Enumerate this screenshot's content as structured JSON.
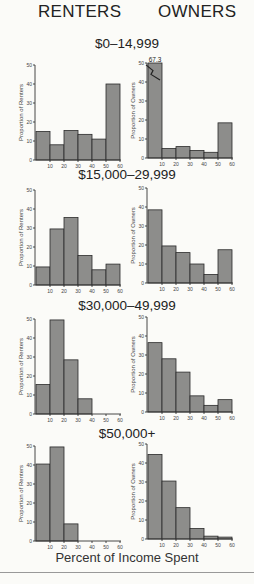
{
  "headers": {
    "renters": "RENTERS",
    "owners": "OWNERS"
  },
  "x_axis_label": "Percent of Income Spent",
  "chart_data": {
    "type": "bar",
    "title": "",
    "xlabel": "Percent of Income Spent",
    "column_titles": [
      "RENTERS",
      "OWNERS"
    ],
    "x_bins": [
      [
        0,
        10
      ],
      [
        10,
        20
      ],
      [
        20,
        30
      ],
      [
        30,
        40
      ],
      [
        40,
        50
      ],
      [
        50,
        60
      ]
    ],
    "x_ticks": [
      10,
      20,
      30,
      40,
      50,
      60
    ],
    "y_ticks": [
      0,
      10,
      20,
      30,
      40,
      50
    ],
    "ylim": [
      0,
      50
    ],
    "xlim": [
      0,
      60
    ],
    "grid": false,
    "panels": [
      {
        "income_group": "$0–14,999",
        "renters": {
          "ylabel": "Proportion of Renters",
          "values": [
            15,
            8,
            15.5,
            13.5,
            11,
            40
          ]
        },
        "owners": {
          "ylabel": "Proportion of Owners",
          "values": [
            67.3,
            5,
            6,
            4,
            3,
            18.5
          ],
          "annotation": "67.3",
          "axis_break": true
        }
      },
      {
        "income_group": "$15,000–29,999",
        "renters": {
          "ylabel": "Proportion of Renters",
          "values": [
            9.5,
            29.5,
            35.5,
            15.5,
            8,
            11
          ]
        },
        "owners": {
          "ylabel": "Proportion of Owners",
          "values": [
            38.5,
            19.5,
            16,
            10,
            4.5,
            17.5
          ]
        }
      },
      {
        "income_group": "$30,000–49,999",
        "renters": {
          "ylabel": "Proportion of Renters",
          "values": [
            15.5,
            49.5,
            28.5,
            8,
            0,
            0
          ]
        },
        "owners": {
          "ylabel": "Proportion of Owners",
          "values": [
            36.5,
            28,
            21,
            8.5,
            3.5,
            6.5
          ]
        }
      },
      {
        "income_group": "$50,000+",
        "renters": {
          "ylabel": "Proportion of Renters",
          "values": [
            40.5,
            49.5,
            9,
            0,
            0,
            0
          ]
        },
        "owners": {
          "ylabel": "Proportion of Owners",
          "values": [
            44.5,
            30.5,
            16.5,
            5.5,
            1.5,
            1
          ]
        }
      }
    ]
  }
}
